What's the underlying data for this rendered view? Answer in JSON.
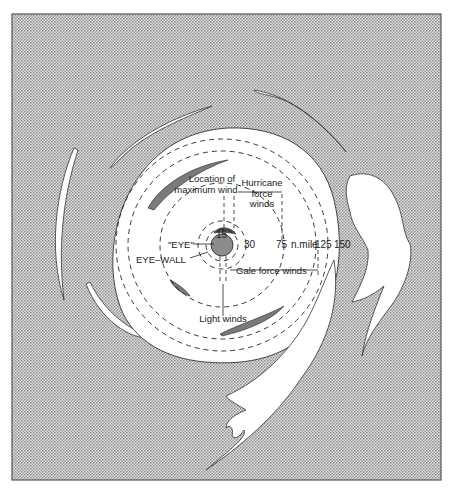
{
  "diagram": {
    "colors": {
      "background": "#ffffff",
      "stipple_dark": "#8a8a8a",
      "stipple_light": "#e4e4e4",
      "cloud": "#ffffff",
      "eye": "#8c8c8c",
      "rain_band": "#7a7a7a",
      "line": "#222222"
    },
    "labels": {
      "location_max_wind_1": "Location of",
      "location_max_wind_2": "maximum wind",
      "hurricane_force_1": "Hurricane",
      "hurricane_force_2": "force",
      "hurricane_force_3": "winds",
      "eye": "\"EYE\"",
      "eye_wall": "EYE–WALL",
      "gale_force": "Gale force winds",
      "light_winds": "Light winds"
    },
    "scale": {
      "r15": "15",
      "r30": "30",
      "r75": "75",
      "unit": "n.mile",
      "r125": "125",
      "r150": "150"
    }
  }
}
